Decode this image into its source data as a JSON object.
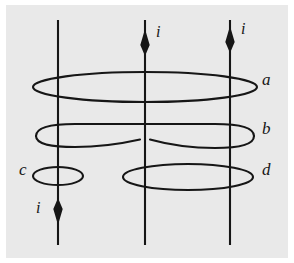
{
  "figure": {
    "kind": "amperian-loops-diagram",
    "panel_background_color": "#e9e9e9",
    "ink_color": "#161616",
    "page_background_color": "#ffffff"
  },
  "wires": [
    {
      "id": "left-wire",
      "x": 58,
      "y_top": 20,
      "y_bottom": 245,
      "current_label": "i",
      "current_direction": "down",
      "arrow_y": 213,
      "label_x": 36,
      "label_y": 206
    },
    {
      "id": "middle-wire",
      "x": 145,
      "y_top": 20,
      "y_bottom": 245,
      "current_label": "i",
      "current_direction": "up",
      "arrow_y": 36,
      "label_x": 156,
      "label_y": 30
    },
    {
      "id": "right-wire",
      "x": 230,
      "y_top": 20,
      "y_bottom": 245,
      "current_label": "i",
      "current_direction": "up",
      "arrow_y": 33,
      "label_x": 241,
      "label_y": 27
    }
  ],
  "loops": [
    {
      "id": "loop-a",
      "label": "a",
      "encloses": [
        "left-wire",
        "middle-wire",
        "right-wire"
      ],
      "cx": 145,
      "cy": 87,
      "rx": 112,
      "ry": 15,
      "shape": "ellipse",
      "label_x": 262,
      "label_y": 78
    },
    {
      "id": "loop-b",
      "label": "b",
      "encloses": [
        "left-wire",
        "middle-wire",
        "right-wire"
      ],
      "cx": 145,
      "cy": 136,
      "rx": 110,
      "ry": 13,
      "shape": "pinched-ellipse",
      "label_x": 262,
      "label_y": 127
    },
    {
      "id": "loop-c",
      "label": "c",
      "encloses": [
        "left-wire"
      ],
      "cx": 58,
      "cy": 176,
      "rx": 25,
      "ry": 9,
      "shape": "ellipse",
      "label_x": 20,
      "label_y": 167
    },
    {
      "id": "loop-d",
      "label": "d",
      "encloses": [
        "middle-wire",
        "right-wire"
      ],
      "cx": 188,
      "cy": 177,
      "rx": 65,
      "ry": 13,
      "shape": "ellipse",
      "label_x": 262,
      "label_y": 168
    }
  ]
}
